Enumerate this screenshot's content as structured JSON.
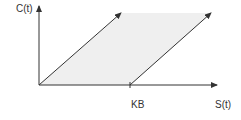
{
  "diagram": {
    "y_axis_label": "C(t)",
    "x_axis_label": "S(t)",
    "x_marker_label": "KB",
    "colors": {
      "line": "#333333",
      "region": "#efefef"
    }
  }
}
